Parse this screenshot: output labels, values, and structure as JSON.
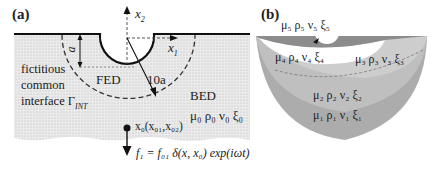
{
  "panel_a": {
    "label": "(a)",
    "axis_x2": "x",
    "axis_x2_sub": "2",
    "axis_x1": "x",
    "axis_x1_sub": "1",
    "depth_label": "a",
    "fed_label": "FED",
    "radius_label": "10a",
    "interface_label_line1": "fictitious",
    "interface_label_line2": "common",
    "interface_label_line3": "interface",
    "interface_symbol": "Γ",
    "interface_symbol_sub": "INT",
    "bed_label": "BED",
    "bed_params": "μ₀ ρ₀  ν₀ ξ₀",
    "source_point": "x₀(x₀₁,x₀₂)",
    "force_equation": "f₁ = f₀₁ δ(x, x₀) exp(iωt)"
  },
  "panel_b": {
    "label": "(b)",
    "layers": [
      {
        "id": 5,
        "params": "μ₅ ρ₅  ν₅ ξ₅",
        "color": "#8a8a8a"
      },
      {
        "id": 4,
        "params": "μ₄ ρ₄  ν₄ ξ₄",
        "color": "#ffffff"
      },
      {
        "id": 3,
        "params": "μ₃ ρ₃  ν₃ ξ₃",
        "color": "#c8c8c8"
      },
      {
        "id": 2,
        "params": "μ₂ ρ₂  ν₂ ξ₂",
        "color": "#bdbdbd"
      },
      {
        "id": 1,
        "params": "μ₁ ρ₁  ν₁ ξ₁",
        "color": "#ababab"
      }
    ]
  }
}
